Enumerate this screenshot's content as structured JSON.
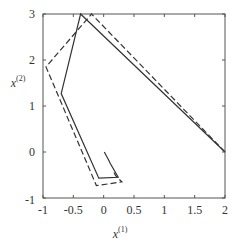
{
  "chart_data": {
    "type": "line",
    "title": "",
    "xlabel": "x",
    "xlabel_sup": "(1)",
    "ylabel": "x",
    "ylabel_sup": "(2)",
    "xlim": [
      -1,
      2
    ],
    "ylim": [
      -1,
      3
    ],
    "grid": false,
    "legend": "none",
    "x_ticks": [
      -1,
      -0.5,
      0,
      0.5,
      1,
      1.5,
      2
    ],
    "x_tick_labels": [
      "-1",
      "-0.5",
      "0",
      "0.5",
      "1",
      "1.5",
      "2"
    ],
    "y_ticks": [
      -1,
      0,
      1,
      2,
      3
    ],
    "y_tick_labels": [
      "-1",
      "0",
      "1",
      "2",
      "3"
    ],
    "series": [
      {
        "name": "solid-trajectory",
        "style": "solid",
        "color": "#333333",
        "x": [
          2.0,
          -0.38,
          -0.7,
          -0.08,
          0.24,
          0.11,
          0.08,
          0.01
        ],
        "y": [
          0.0,
          3.0,
          1.27,
          -0.57,
          -0.55,
          -0.25,
          -0.17,
          0.0
        ]
      },
      {
        "name": "dashed-trajectory",
        "style": "dashed",
        "color": "#333333",
        "x": [
          2.0,
          -0.2,
          -0.95,
          -0.12,
          0.3,
          0.2,
          0.16
        ],
        "y": [
          0.0,
          3.0,
          1.85,
          -0.73,
          -0.65,
          -0.52,
          -0.42
        ]
      }
    ]
  }
}
